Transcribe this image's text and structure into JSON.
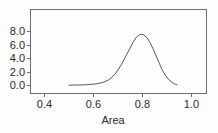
{
  "chart_data": {
    "type": "line",
    "title": "",
    "subtitle": "",
    "xlabel": "Area",
    "ylabel": "",
    "xlim": [
      0.355,
      1.04
    ],
    "ylim": [
      -0.35,
      9.1
    ],
    "grid": false,
    "legend": "none",
    "annotations": [],
    "xticks": [
      0.4,
      0.6,
      0.8,
      1.0
    ],
    "xtick_labels": [
      "0.4",
      "0.6",
      "0.8",
      "1.0"
    ],
    "yticks": [
      0.0,
      2.0,
      4.0,
      6.0,
      8.0
    ],
    "ytick_labels": [
      "0.0",
      "2.0",
      "4.0",
      "6.0",
      "8.0"
    ],
    "series": [
      {
        "name": "density",
        "x": [
          0.5,
          0.515,
          0.53,
          0.545,
          0.56,
          0.575,
          0.59,
          0.605,
          0.62,
          0.635,
          0.65,
          0.662,
          0.675,
          0.688,
          0.7,
          0.712,
          0.725,
          0.737,
          0.75,
          0.762,
          0.775,
          0.787,
          0.795,
          0.805,
          0.818,
          0.83,
          0.843,
          0.855,
          0.868,
          0.88,
          0.893,
          0.905,
          0.918,
          0.93,
          0.94
        ],
        "y": [
          0.05,
          0.06,
          0.07,
          0.08,
          0.1,
          0.13,
          0.17,
          0.22,
          0.3,
          0.42,
          0.62,
          0.85,
          1.2,
          1.7,
          2.3,
          3.0,
          3.85,
          4.7,
          5.6,
          6.45,
          7.15,
          7.52,
          7.58,
          7.5,
          7.1,
          6.4,
          5.45,
          4.4,
          3.35,
          2.35,
          1.55,
          0.95,
          0.52,
          0.25,
          0.12
        ]
      }
    ],
    "colors": {
      "curve": "#555555",
      "axis": "#6e6e6e",
      "text": "#2b2b2b",
      "background": "#fdfdfd"
    }
  },
  "figure": {
    "axis_title_x": "Area"
  }
}
